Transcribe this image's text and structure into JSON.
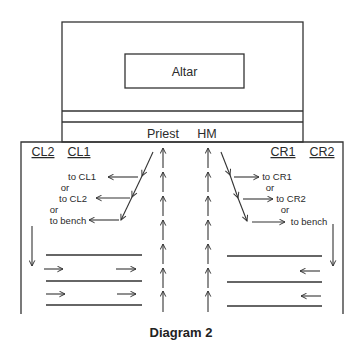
{
  "diagram": {
    "caption": "Diagram 2",
    "sanctuary": {
      "altar_label": "Altar"
    },
    "ministers": {
      "left": "Priest",
      "right": "HM"
    },
    "left_side": {
      "columns": [
        "CL2",
        "CL1"
      ],
      "destinations": [
        "to CL1",
        "or",
        "to CL2",
        "or",
        "to bench"
      ]
    },
    "right_side": {
      "columns": [
        "CR1",
        "CR2"
      ],
      "destinations": [
        "to CR1",
        "or",
        "to CR2",
        "or",
        "to bench"
      ]
    },
    "center_aisle": {
      "arrow_count_per_column": 7,
      "direction": "up"
    },
    "pews": {
      "left_rows": 3,
      "right_rows": 3,
      "left_flow": "right",
      "right_flow": "left"
    },
    "colors": {
      "line": "#333333",
      "text": "#2a2a2a",
      "background": "#ffffff"
    }
  }
}
